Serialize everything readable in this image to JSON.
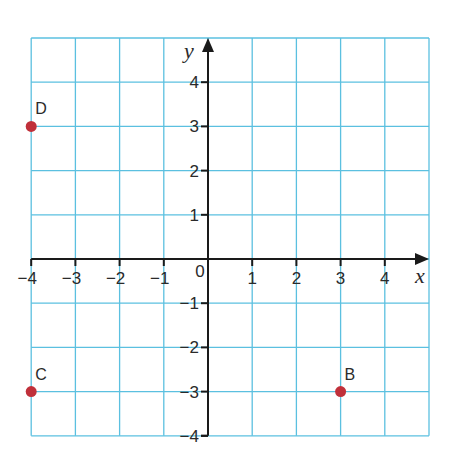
{
  "chart_data": {
    "type": "scatter",
    "title": "",
    "xlabel": "x",
    "ylabel": "y",
    "xlim": [
      -4,
      5
    ],
    "ylim": [
      -4,
      5
    ],
    "grid": true,
    "x_ticks": [
      -4,
      -3,
      -2,
      -1,
      1,
      2,
      3,
      4
    ],
    "y_ticks": [
      4,
      3,
      2,
      1,
      -1,
      -2,
      -3,
      -4
    ],
    "origin_label": "0",
    "points": [
      {
        "label": "D",
        "x": -4,
        "y": 3
      },
      {
        "label": "C",
        "x": -4,
        "y": -3
      },
      {
        "label": "B",
        "x": 3,
        "y": -3
      }
    ],
    "colors": {
      "grid": "#5bc0e0",
      "axis": "#1a1a1a",
      "point": "#c0303a"
    }
  }
}
